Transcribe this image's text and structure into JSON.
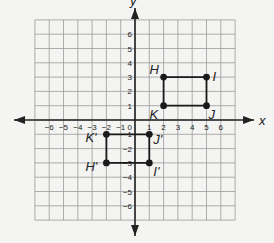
{
  "diagram": {
    "type": "coordinate-grid-translation",
    "axes": {
      "x_label": "x",
      "y_label": "y",
      "x_ticks": [
        -6,
        -5,
        -4,
        -3,
        -2,
        -1,
        1,
        2,
        3,
        4,
        5,
        6
      ],
      "y_ticks": [
        6,
        5,
        4,
        3,
        2,
        1,
        -1,
        -2,
        -3,
        -4,
        -5,
        -6
      ],
      "origin_label": "0",
      "grid_range": [
        -7,
        7
      ]
    },
    "figures": [
      {
        "name": "HIJK",
        "points": [
          {
            "label": "H",
            "x": 2,
            "y": 3
          },
          {
            "label": "I",
            "x": 5,
            "y": 3
          },
          {
            "label": "J",
            "x": 5,
            "y": 1
          },
          {
            "label": "K",
            "x": 2,
            "y": 1
          }
        ]
      },
      {
        "name": "H'I'J'K'",
        "points": [
          {
            "label": "H'",
            "x": -2,
            "y": -3
          },
          {
            "label": "I'",
            "x": 1,
            "y": -3
          },
          {
            "label": "J'",
            "x": 1,
            "y": -1
          },
          {
            "label": "K'",
            "x": -2,
            "y": -1
          }
        ]
      }
    ],
    "colors": {
      "background": "#f4f4f2",
      "grid": "#9a9a9a",
      "axis": "#222222",
      "figure": "#1a1a1a"
    }
  }
}
